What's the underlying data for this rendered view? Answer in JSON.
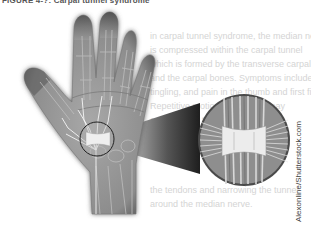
{
  "figure": {
    "title": "FIGURE 4-?: Carpal tunnel syndrome",
    "credit": "Alexonline/Shutterstock.com",
    "callout": "magnified-carpal-tunnel"
  },
  "ghost_text": {
    "lines": [
      "in carpal tunnel syndrome, the median nerve",
      "is compressed within the carpal tunnel",
      "which is formed by the transverse carpal ligament",
      "and the carpal bones. Symptoms include numbness",
      "tingling, and pain in the thumb and first fingers.",
      "Repetitive motion of the wrist may",
      "contribute to the inflammation of",
      "the tendons and narrowing the tunnel",
      "around the median nerve."
    ]
  },
  "colors": {
    "hand_fill": "#9a9a9a",
    "hand_shadow": "#6a6a6a",
    "bone_line": "#7d7d7d",
    "nerve": "#f2f2f2",
    "ligament": "#e9e9e9",
    "callout_dark": "#2a2a2a"
  }
}
